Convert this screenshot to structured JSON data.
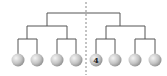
{
  "diagram": {
    "type": "binary-tree",
    "levels": 4,
    "leaf_count": 8,
    "divider": "dashed-vertical-line",
    "leaves": [
      {
        "index": 1,
        "label": ""
      },
      {
        "index": 2,
        "label": ""
      },
      {
        "index": 3,
        "label": ""
      },
      {
        "index": 4,
        "label": ""
      },
      {
        "index": 5,
        "label": "4"
      },
      {
        "index": 6,
        "label": ""
      },
      {
        "index": 7,
        "label": ""
      },
      {
        "index": 8,
        "label": ""
      }
    ],
    "colors": {
      "line": "#555555",
      "ball_light": "#f2f2f2",
      "ball_dark": "#9a9a9a",
      "divider": "#888888"
    }
  }
}
